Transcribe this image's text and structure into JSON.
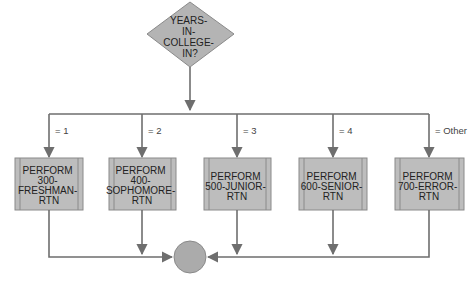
{
  "decision": {
    "lines": [
      "YEARS-",
      "IN-",
      "COLLEGE-",
      "IN?"
    ],
    "fill": "#b4b4b4",
    "stroke": "#8a8a8a"
  },
  "branches": [
    {
      "label": "= 1",
      "process": {
        "lines": [
          "PERFORM",
          "300-",
          "FRESHMAN-",
          "RTN"
        ]
      }
    },
    {
      "label": "= 2",
      "process": {
        "lines": [
          "PERFORM",
          "400-",
          "SOPHOMORE-",
          "RTN"
        ]
      }
    },
    {
      "label": "= 3",
      "process": {
        "lines": [
          "PERFORM",
          "500-JUNIOR-",
          "RTN"
        ]
      }
    },
    {
      "label": "= 4",
      "process": {
        "lines": [
          "PERFORM",
          "600-SENIOR-",
          "RTN"
        ]
      }
    },
    {
      "label": "= Other",
      "process": {
        "lines": [
          "PERFORM",
          "700-ERROR-",
          "RTN"
        ]
      }
    }
  ],
  "connector": {
    "fill": "#ababab",
    "stroke": "#8a8a8a"
  },
  "colors": {
    "process_fill": "#bdbdbd",
    "process_stroke": "#8a8a8a",
    "line": "#6e6e6e"
  }
}
